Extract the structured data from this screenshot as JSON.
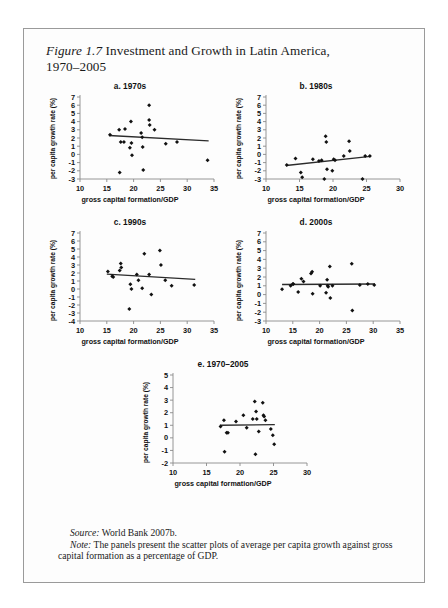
{
  "figure": {
    "number_label": "Figure 1.7",
    "title_line1": " Investment and Growth in Latin America,",
    "title_line2": "1970–2005"
  },
  "axis_labels": {
    "x": "gross capital formation/GDP",
    "y": "per capita growth rate (%)"
  },
  "notes": {
    "source_lead": "Source:",
    "source_text": " World Bank 2007b.",
    "note_lead": "Note:",
    "note_text": " The panels present the scatter plots of average per capita growth against gross capital formation as a percentage of GDP."
  },
  "chart_data": [
    {
      "id": "a",
      "type": "scatter",
      "title": "a. 1970s",
      "xlabel": "gross capital formation/GDP",
      "ylabel": "per capita growth rate (%)",
      "xlim": [
        10,
        35
      ],
      "ylim": [
        -3,
        7
      ],
      "xticks": [
        10,
        15,
        20,
        25,
        30,
        35
      ],
      "yticks": [
        -3,
        -2,
        -1,
        0,
        1,
        2,
        3,
        4,
        5,
        6,
        7
      ],
      "grid": false,
      "points": [
        {
          "x": 15.6,
          "y": 2.4
        },
        {
          "x": 17.3,
          "y": 3.0
        },
        {
          "x": 17.4,
          "y": -2.2
        },
        {
          "x": 17.6,
          "y": 1.5
        },
        {
          "x": 18.2,
          "y": 1.5
        },
        {
          "x": 18.4,
          "y": 3.1
        },
        {
          "x": 19.3,
          "y": 0.8
        },
        {
          "x": 19.5,
          "y": 4.0
        },
        {
          "x": 19.6,
          "y": 1.4
        },
        {
          "x": 19.7,
          "y": -0.1
        },
        {
          "x": 21.4,
          "y": 2.6
        },
        {
          "x": 21.6,
          "y": 2.1
        },
        {
          "x": 21.7,
          "y": 0.9
        },
        {
          "x": 21.8,
          "y": -1.9
        },
        {
          "x": 22.9,
          "y": 6.0
        },
        {
          "x": 22.9,
          "y": 4.2
        },
        {
          "x": 23.0,
          "y": 3.6
        },
        {
          "x": 23.9,
          "y": 3.0
        },
        {
          "x": 26.0,
          "y": 1.3
        },
        {
          "x": 28.1,
          "y": 1.5
        },
        {
          "x": 33.8,
          "y": -0.7
        }
      ],
      "trend": {
        "x1": 15.4,
        "y1": 2.3,
        "x2": 34.0,
        "y2": 1.65
      }
    },
    {
      "id": "b",
      "type": "scatter",
      "title": "b. 1980s",
      "xlabel": "gross capital formation/GDP",
      "ylabel": "per capita growth rate (%)",
      "xlim": [
        10,
        30
      ],
      "ylim": [
        -3,
        7
      ],
      "xticks": [
        10,
        15,
        20,
        25,
        30
      ],
      "yticks": [
        -3,
        -2,
        -1,
        0,
        1,
        2,
        3,
        4,
        5,
        6,
        7
      ],
      "grid": false,
      "points": [
        {
          "x": 13.1,
          "y": -1.3
        },
        {
          "x": 14.4,
          "y": -0.5
        },
        {
          "x": 15.2,
          "y": -2.2
        },
        {
          "x": 15.4,
          "y": -2.8
        },
        {
          "x": 17.0,
          "y": -0.6
        },
        {
          "x": 17.9,
          "y": -0.8
        },
        {
          "x": 18.3,
          "y": -0.7
        },
        {
          "x": 18.7,
          "y": -3.0
        },
        {
          "x": 18.9,
          "y": 2.2
        },
        {
          "x": 19.0,
          "y": 1.5
        },
        {
          "x": 19.1,
          "y": -1.8
        },
        {
          "x": 19.9,
          "y": -2.0
        },
        {
          "x": 20.1,
          "y": -0.6
        },
        {
          "x": 20.3,
          "y": -0.7
        },
        {
          "x": 21.6,
          "y": -0.2
        },
        {
          "x": 22.4,
          "y": 1.6
        },
        {
          "x": 22.5,
          "y": 0.4
        },
        {
          "x": 24.4,
          "y": -3.0
        },
        {
          "x": 24.8,
          "y": -0.2
        },
        {
          "x": 25.5,
          "y": -0.2
        }
      ],
      "trend": {
        "x1": 13.0,
        "y1": -1.35,
        "x2": 25.6,
        "y2": -0.25
      }
    },
    {
      "id": "c",
      "type": "scatter",
      "title": "c. 1990s",
      "xlabel": "gross capital formation/GDP",
      "ylabel": "per capita growth rate (%)",
      "xlim": [
        10,
        35
      ],
      "ylim": [
        -4,
        7
      ],
      "xticks": [
        10,
        15,
        20,
        25,
        30,
        35
      ],
      "yticks": [
        -4,
        -3,
        -2,
        -1,
        0,
        1,
        2,
        3,
        4,
        5,
        6,
        7
      ],
      "grid": false,
      "points": [
        {
          "x": 15.2,
          "y": 2.2
        },
        {
          "x": 16.0,
          "y": 1.6
        },
        {
          "x": 16.2,
          "y": 1.5
        },
        {
          "x": 17.4,
          "y": 2.3
        },
        {
          "x": 17.6,
          "y": 3.2
        },
        {
          "x": 17.7,
          "y": 2.7
        },
        {
          "x": 19.2,
          "y": -2.5
        },
        {
          "x": 19.4,
          "y": 0.6
        },
        {
          "x": 19.6,
          "y": 0.0
        },
        {
          "x": 20.6,
          "y": 1.8
        },
        {
          "x": 20.9,
          "y": 1.1
        },
        {
          "x": 21.6,
          "y": 0.1
        },
        {
          "x": 22.0,
          "y": 4.4
        },
        {
          "x": 22.9,
          "y": 1.8
        },
        {
          "x": 23.3,
          "y": -0.7
        },
        {
          "x": 24.9,
          "y": 4.8
        },
        {
          "x": 25.1,
          "y": 3.0
        },
        {
          "x": 25.9,
          "y": 1.1
        },
        {
          "x": 27.1,
          "y": 0.4
        },
        {
          "x": 31.3,
          "y": 0.5
        }
      ],
      "trend": {
        "x1": 15.0,
        "y1": 1.85,
        "x2": 31.5,
        "y2": 1.2
      }
    },
    {
      "id": "d",
      "type": "scatter",
      "title": "d. 2000s",
      "xlabel": "gross capital formation/GDP",
      "ylabel": "per capita growth rate (%)",
      "xlim": [
        10,
        35
      ],
      "ylim": [
        -3,
        7
      ],
      "xticks": [
        10,
        15,
        20,
        25,
        30,
        35
      ],
      "yticks": [
        -3,
        -2,
        -1,
        0,
        1,
        2,
        3,
        4,
        5,
        6,
        7
      ],
      "grid": false,
      "points": [
        {
          "x": 13.0,
          "y": 0.6
        },
        {
          "x": 14.6,
          "y": 1.0
        },
        {
          "x": 15.0,
          "y": 1.2
        },
        {
          "x": 15.1,
          "y": 1.2
        },
        {
          "x": 16.0,
          "y": 0.3
        },
        {
          "x": 16.6,
          "y": 1.8
        },
        {
          "x": 17.0,
          "y": 1.5
        },
        {
          "x": 18.4,
          "y": 2.4
        },
        {
          "x": 18.6,
          "y": 2.6
        },
        {
          "x": 18.7,
          "y": 0.1
        },
        {
          "x": 20.1,
          "y": 1.0
        },
        {
          "x": 21.2,
          "y": 0.2
        },
        {
          "x": 21.4,
          "y": 1.7
        },
        {
          "x": 21.5,
          "y": 1.0
        },
        {
          "x": 21.6,
          "y": 0.9
        },
        {
          "x": 21.9,
          "y": 3.2
        },
        {
          "x": 22.0,
          "y": -0.4
        },
        {
          "x": 22.4,
          "y": 1.0
        },
        {
          "x": 26.0,
          "y": 3.5
        },
        {
          "x": 26.1,
          "y": -1.8
        },
        {
          "x": 27.5,
          "y": 1.1
        },
        {
          "x": 29.0,
          "y": 1.2
        },
        {
          "x": 30.2,
          "y": 1.1
        }
      ],
      "trend": {
        "x1": 13.0,
        "y1": 1.15,
        "x2": 30.3,
        "y2": 1.2
      }
    },
    {
      "id": "e",
      "type": "scatter",
      "title": "e. 1970–2005",
      "xlabel": "gross capital formation/GDP",
      "ylabel": "per capita growth rate (%)",
      "xlim": [
        10,
        30
      ],
      "ylim": [
        -2,
        5
      ],
      "xticks": [
        10,
        15,
        20,
        25,
        30
      ],
      "yticks": [
        -2,
        -1,
        0,
        1,
        2,
        3,
        4,
        5
      ],
      "grid": false,
      "points": [
        {
          "x": 17.1,
          "y": 0.9
        },
        {
          "x": 17.6,
          "y": 1.4
        },
        {
          "x": 17.7,
          "y": -1.1
        },
        {
          "x": 18.0,
          "y": 0.4
        },
        {
          "x": 18.2,
          "y": 0.4
        },
        {
          "x": 19.4,
          "y": 1.3
        },
        {
          "x": 20.5,
          "y": 1.8
        },
        {
          "x": 21.0,
          "y": 0.8
        },
        {
          "x": 21.9,
          "y": 1.5
        },
        {
          "x": 22.2,
          "y": 2.9
        },
        {
          "x": 22.3,
          "y": -1.3
        },
        {
          "x": 22.4,
          "y": 2.1
        },
        {
          "x": 22.5,
          "y": 1.5
        },
        {
          "x": 22.8,
          "y": 0.5
        },
        {
          "x": 23.4,
          "y": 2.8
        },
        {
          "x": 23.5,
          "y": 1.8
        },
        {
          "x": 23.6,
          "y": 1.7
        },
        {
          "x": 23.8,
          "y": 1.4
        },
        {
          "x": 24.6,
          "y": 0.7
        },
        {
          "x": 24.9,
          "y": 0.2
        },
        {
          "x": 25.1,
          "y": -0.5
        }
      ],
      "trend": {
        "x1": 17.0,
        "y1": 1.0,
        "x2": 25.2,
        "y2": 1.05
      }
    }
  ]
}
